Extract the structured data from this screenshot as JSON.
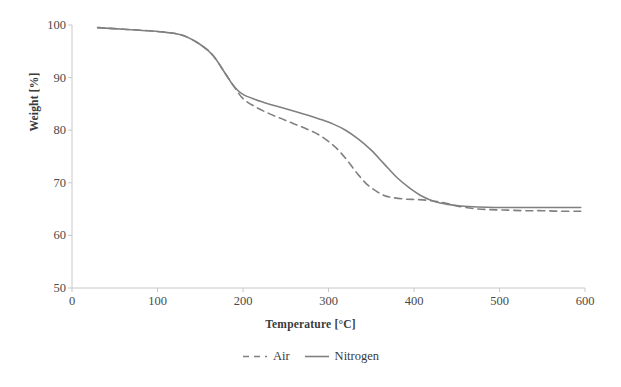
{
  "chart_data": {
    "type": "line",
    "title": "",
    "xlabel": "Temperature [°C]",
    "ylabel": "Weight [%]",
    "xlim": [
      0,
      600
    ],
    "ylim": [
      50,
      100
    ],
    "xticks": [
      0,
      100,
      200,
      300,
      400,
      500,
      600
    ],
    "yticks": [
      50,
      60,
      70,
      80,
      90,
      100
    ],
    "grid": false,
    "legend_position": "bottom",
    "colors": {
      "air": "#808080",
      "nitrogen": "#808080",
      "axis": "#bfbfbf",
      "text": "#3a3a3a"
    },
    "series": [
      {
        "name": "Air",
        "style": "dashed",
        "x": [
          30,
          60,
          90,
          110,
          130,
          150,
          165,
          180,
          190,
          200,
          215,
          230,
          245,
          260,
          275,
          290,
          305,
          315,
          325,
          335,
          345,
          355,
          365,
          375,
          390,
          405,
          420,
          435,
          450,
          470,
          490,
          510,
          530,
          550,
          570,
          595
        ],
        "y": [
          99.5,
          99.2,
          98.9,
          98.6,
          98.0,
          96.3,
          94.2,
          90.6,
          88.2,
          86.0,
          84.4,
          83.2,
          82.2,
          81.2,
          80.2,
          79.0,
          77.2,
          75.6,
          73.6,
          71.5,
          69.7,
          68.5,
          67.6,
          67.2,
          66.9,
          66.8,
          66.6,
          66.2,
          65.6,
          65.1,
          64.9,
          64.8,
          64.7,
          64.7,
          64.6,
          64.6
        ]
      },
      {
        "name": "Nitrogen",
        "style": "solid",
        "x": [
          30,
          60,
          90,
          110,
          130,
          150,
          165,
          180,
          190,
          200,
          215,
          230,
          245,
          260,
          275,
          290,
          305,
          320,
          335,
          350,
          365,
          380,
          395,
          410,
          425,
          440,
          455,
          475,
          495,
          515,
          535,
          555,
          575,
          595
        ],
        "y": [
          99.5,
          99.2,
          98.9,
          98.6,
          98.0,
          96.3,
          94.2,
          90.6,
          88.2,
          86.8,
          85.8,
          85.0,
          84.3,
          83.6,
          82.9,
          82.1,
          81.2,
          80.0,
          78.3,
          76.2,
          73.6,
          71.0,
          69.0,
          67.4,
          66.4,
          65.9,
          65.6,
          65.4,
          65.3,
          65.3,
          65.3,
          65.3,
          65.3,
          65.3
        ]
      }
    ],
    "annotations": []
  },
  "legend": {
    "entries": [
      {
        "label": "Air",
        "style": "dashed"
      },
      {
        "label": "Nitrogen",
        "style": "solid"
      }
    ]
  }
}
